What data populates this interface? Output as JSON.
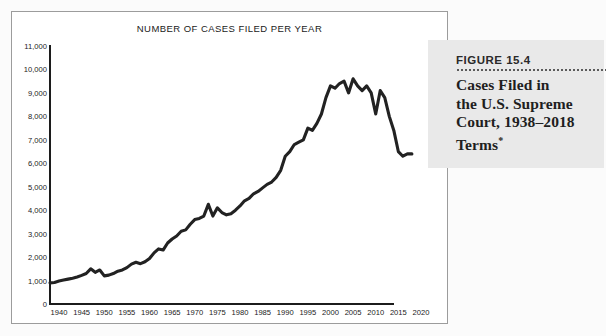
{
  "figure": {
    "number_label": "FIGURE 15.4",
    "title_line_1": "Cases Filed in",
    "title_line_2": "the U.S. Supreme",
    "title_line_3": "Court, 1938–2018",
    "title_line_4": "Terms",
    "title_footnote_marker": "*",
    "panel_background": "#e9e9e9"
  },
  "chart_data": {
    "type": "line",
    "title": "NUMBER OF CASES FILED PER YEAR",
    "xlabel": "",
    "ylabel": "",
    "xlim": [
      1938,
      2022
    ],
    "ylim": [
      0,
      11000
    ],
    "grid": false,
    "legend": null,
    "line_color": "#222222",
    "y_ticks": [
      0,
      1000,
      2000,
      3000,
      4000,
      5000,
      6000,
      7000,
      8000,
      9000,
      10000,
      11000
    ],
    "y_tick_labels": [
      "0",
      "1,000",
      "2,000",
      "3,000",
      "4,000",
      "5,000",
      "6,000",
      "7,000",
      "8,000",
      "9,000",
      "10,000",
      "11,000"
    ],
    "x_ticks": [
      1940,
      1945,
      1950,
      1955,
      1960,
      1965,
      1970,
      1975,
      1980,
      1985,
      1990,
      1995,
      2000,
      2005,
      2010,
      2015,
      2020
    ],
    "x_tick_labels": [
      "1940",
      "1945",
      "1950",
      "1955",
      "1960",
      "1965",
      "1970",
      "1975",
      "1980",
      "1985",
      "1990",
      "1995",
      "2000",
      "2005",
      "2010",
      "2015",
      "2020"
    ],
    "x": [
      1938,
      1939,
      1940,
      1941,
      1942,
      1943,
      1944,
      1945,
      1946,
      1947,
      1948,
      1949,
      1950,
      1951,
      1952,
      1953,
      1954,
      1955,
      1956,
      1957,
      1958,
      1959,
      1960,
      1961,
      1962,
      1963,
      1964,
      1965,
      1966,
      1967,
      1968,
      1969,
      1970,
      1971,
      1972,
      1973,
      1974,
      1975,
      1976,
      1977,
      1978,
      1979,
      1980,
      1981,
      1982,
      1983,
      1984,
      1985,
      1986,
      1987,
      1988,
      1989,
      1990,
      1991,
      1992,
      1993,
      1994,
      1995,
      1996,
      1997,
      1998,
      1999,
      2000,
      2001,
      2002,
      2003,
      2004,
      2005,
      2006,
      2007,
      2008,
      2009,
      2010,
      2011,
      2012,
      2013,
      2014,
      2015,
      2016,
      2017,
      2018
    ],
    "values": [
      900,
      920,
      980,
      1020,
      1060,
      1100,
      1150,
      1220,
      1300,
      1500,
      1350,
      1450,
      1200,
      1230,
      1300,
      1400,
      1450,
      1550,
      1700,
      1780,
      1720,
      1800,
      1940,
      2180,
      2350,
      2300,
      2600,
      2770,
      2900,
      3100,
      3160,
      3400,
      3600,
      3650,
      3750,
      4250,
      3750,
      4100,
      3900,
      3800,
      3850,
      4000,
      4180,
      4400,
      4500,
      4700,
      4800,
      4950,
      5100,
      5200,
      5400,
      5700,
      6300,
      6500,
      6800,
      6900,
      7000,
      7500,
      7400,
      7700,
      8100,
      8800,
      9300,
      9200,
      9400,
      9500,
      9000,
      9600,
      9300,
      9100,
      9300,
      9000,
      8100,
      9100,
      8800,
      8000,
      7400,
      6500,
      6300,
      6400,
      6400
    ]
  }
}
